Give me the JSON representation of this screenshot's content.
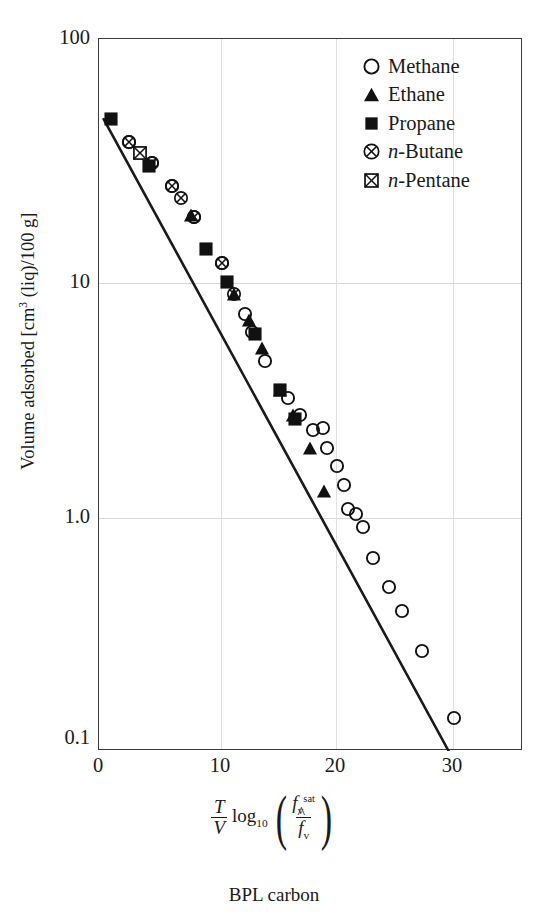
{
  "chart_data": {
    "type": "scatter",
    "title": "",
    "caption": "BPL carbon",
    "xlabel_parts": {
      "frac_num": "T",
      "frac_den": "V",
      "log": "log",
      "log_sub": "10",
      "arg_num_base": "f",
      "arg_num_sub": "v",
      "arg_num_sup": "sat",
      "arg_den_base": "f",
      "arg_den_sub": "v",
      "arg_den_hat": "^"
    },
    "ylabel": "Volume adsorbed [cm3 (liq)/100 g]",
    "ylabel_display": "Volume adsorbed [cm",
    "ylabel_sup": "3",
    "ylabel_tail": " (liq)/100 g]",
    "xscale": "linear",
    "yscale": "log",
    "xlim": [
      0,
      36.5
    ],
    "ylim": [
      0.1,
      100
    ],
    "xticks": [
      "0",
      "10",
      "20",
      "30"
    ],
    "xtick_values": [
      0,
      10,
      20,
      30
    ],
    "yticks": [
      "100",
      "10",
      "1.0",
      "0.1"
    ],
    "ytick_values": [
      100,
      10,
      1.0,
      0.1
    ],
    "grid": "both",
    "legend_position": "upper-right",
    "series": [
      {
        "name": "Methane",
        "marker": "open-circle",
        "points": [
          [
            12.6,
            6.8
          ],
          [
            13.2,
            5.7
          ],
          [
            14.3,
            4.3
          ],
          [
            16.3,
            3.0
          ],
          [
            17.3,
            2.55
          ],
          [
            18.4,
            2.2
          ],
          [
            19.3,
            2.25
          ],
          [
            19.6,
            1.85
          ],
          [
            20.5,
            1.55
          ],
          [
            21.1,
            1.3
          ],
          [
            21.4,
            1.03
          ],
          [
            22.1,
            0.98
          ],
          [
            22.7,
            0.86
          ],
          [
            23.6,
            0.64
          ],
          [
            25.0,
            0.48
          ],
          [
            26.1,
            0.38
          ],
          [
            27.8,
            0.26
          ],
          [
            30.6,
            0.135
          ],
          [
            2.6,
            36.0
          ],
          [
            4.6,
            29.5
          ],
          [
            6.3,
            23.5
          ],
          [
            8.2,
            17.5
          ],
          [
            10.6,
            11.2
          ]
        ]
      },
      {
        "name": "Ethane",
        "marker": "filled-triangle",
        "points": [
          [
            7.9,
            17.8
          ],
          [
            11.6,
            8.3
          ],
          [
            12.9,
            6.4
          ],
          [
            14.0,
            4.9
          ],
          [
            15.6,
            3.25
          ],
          [
            16.7,
            2.55
          ],
          [
            18.2,
            1.85
          ],
          [
            19.4,
            1.22
          ]
        ]
      },
      {
        "name": "Propane",
        "marker": "filled-square",
        "points": [
          [
            1.0,
            45.0
          ],
          [
            4.3,
            28.5
          ],
          [
            9.2,
            12.8
          ],
          [
            11.0,
            9.3
          ],
          [
            13.4,
            5.6
          ],
          [
            15.6,
            3.25
          ],
          [
            16.9,
            2.45
          ]
        ]
      },
      {
        "name": "n-Butane",
        "marker": "circle-x",
        "points": [
          [
            2.6,
            36.0
          ],
          [
            4.6,
            29.5
          ],
          [
            6.3,
            23.5
          ],
          [
            7.1,
            21.0
          ],
          [
            8.2,
            17.5
          ],
          [
            10.6,
            11.2
          ],
          [
            11.6,
            8.3
          ]
        ]
      },
      {
        "name": "n-Pentane",
        "marker": "square-x",
        "points": [
          [
            3.5,
            32.5
          ]
        ]
      }
    ],
    "fit_line": {
      "name": "correlation-line",
      "points": [
        [
          0.4,
          46.0
        ],
        [
          30.1,
          0.1
        ]
      ]
    }
  },
  "legend": {
    "items": [
      {
        "label": "Methane",
        "marker": "open-circle"
      },
      {
        "label": "Ethane",
        "marker": "filled-triangle"
      },
      {
        "label": "Propane",
        "marker": "filled-square"
      },
      {
        "label": "n-Butane",
        "marker": "circle-x",
        "italic_prefix": "n",
        "rest": "-Butane"
      },
      {
        "label": "n-Pentane",
        "marker": "square-x",
        "italic_prefix": "n",
        "rest": "-Pentane"
      }
    ]
  },
  "colors": {
    "ink": "#1a1a1a",
    "frame": "#3a3a3a",
    "grid": "#d8d8d8",
    "marker_fill": "#111111",
    "background": "#ffffff"
  }
}
